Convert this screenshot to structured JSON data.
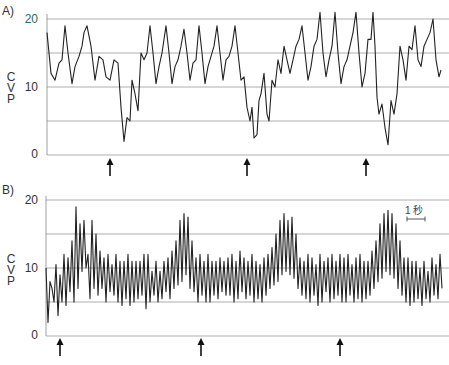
{
  "figure": {
    "panels": [
      {
        "label": "A)",
        "ylabel": [
          "C",
          "V",
          "P"
        ],
        "ticks": [
          "20",
          "10",
          "0"
        ],
        "tick_color_top": "#2a6b5a"
      },
      {
        "label": "B)",
        "ylabel": [
          "C",
          "V",
          "P"
        ],
        "ticks": [
          "20",
          "10",
          "0"
        ]
      }
    ],
    "scale_bar": {
      "label": "1 秒"
    }
  },
  "chart_data": [
    {
      "type": "line",
      "title": "A)",
      "ylabel": "CVP",
      "xlabel": "",
      "ylim": [
        0,
        20
      ],
      "yticks_labeled": [
        0,
        10,
        20
      ],
      "gridlines": [
        0,
        5,
        10,
        15,
        20
      ],
      "grid": true,
      "annotations": [
        {
          "type": "arrow",
          "x_px": 110,
          "description": "upward arrow marking event"
        },
        {
          "type": "arrow",
          "x_px": 247,
          "description": "upward arrow marking event"
        },
        {
          "type": "arrow",
          "x_px": 366,
          "description": "upward arrow marking event"
        }
      ],
      "x_px": [
        47,
        51,
        55,
        59,
        62,
        65,
        68,
        72,
        75,
        79,
        82,
        84,
        87,
        91,
        95,
        99,
        103,
        106,
        110,
        114,
        118,
        121,
        124,
        127,
        130,
        132,
        135,
        138,
        141,
        144,
        147,
        150,
        153,
        156,
        159,
        162,
        166,
        169,
        172,
        175,
        178,
        181,
        184,
        187,
        190,
        193,
        196,
        199,
        202,
        205,
        208,
        211,
        214,
        217,
        220,
        223,
        226,
        229,
        232,
        235,
        238,
        241,
        244,
        247,
        250,
        252,
        254,
        257,
        259,
        261,
        264,
        267,
        269,
        272,
        275,
        278,
        281,
        284,
        287,
        290,
        293,
        296,
        299,
        302,
        305,
        308,
        311,
        314,
        317,
        320,
        323,
        326,
        329,
        332,
        335,
        338,
        341,
        344,
        347,
        350,
        353,
        356,
        359,
        362,
        365,
        368,
        371,
        373,
        375,
        377,
        379,
        382,
        385,
        388,
        391,
        394,
        397,
        400,
        403,
        406,
        409,
        412,
        415,
        418,
        421,
        424,
        427,
        430,
        433,
        436,
        439,
        441
      ],
      "values": [
        18,
        12,
        11,
        13.5,
        14,
        19,
        15,
        10.5,
        13,
        14.5,
        16,
        18,
        19,
        16,
        11,
        14.5,
        14,
        11.5,
        11,
        14,
        13.5,
        7,
        2,
        5.5,
        5,
        11,
        9,
        6.5,
        15,
        14,
        15,
        19,
        15,
        10.5,
        13,
        15,
        19,
        15,
        10.5,
        13,
        14,
        16,
        18.5,
        15,
        11,
        13.5,
        14,
        19,
        15,
        10.5,
        13,
        14.5,
        16,
        19,
        15,
        11,
        14,
        14.5,
        16,
        19,
        15,
        11,
        11.5,
        7,
        5,
        7,
        2.5,
        3,
        8,
        9,
        12,
        6,
        5,
        11,
        10,
        14,
        12,
        16,
        14,
        12,
        14,
        16,
        17,
        19,
        15,
        11,
        13,
        16,
        17,
        21,
        15,
        11.5,
        14,
        16,
        21,
        15,
        10.5,
        13,
        14,
        16,
        18,
        21,
        15,
        10,
        12,
        17,
        17,
        21,
        16,
        8.5,
        6,
        7.5,
        4,
        1.5,
        8,
        6,
        9,
        16,
        14,
        11,
        16,
        15.5,
        19,
        14,
        13,
        16,
        17,
        18,
        20,
        14,
        11.5,
        12.5,
        16,
        17,
        17.5
      ]
    },
    {
      "type": "line",
      "title": "B)",
      "ylabel": "CVP",
      "xlabel": "",
      "ylim": [
        0,
        20
      ],
      "yticks_labeled": [
        0,
        10,
        20
      ],
      "gridlines": [
        0,
        5,
        10,
        15,
        20
      ],
      "grid": true,
      "annotations": [
        {
          "type": "arrow",
          "x_px": 60,
          "description": "upward arrow marking event"
        },
        {
          "type": "arrow",
          "x_px": 201,
          "description": "upward arrow marking event"
        },
        {
          "type": "arrow",
          "x_px": 340,
          "description": "upward arrow marking event"
        },
        {
          "type": "scale_bar",
          "label": "1 秒",
          "x_px": [
            407,
            425
          ]
        }
      ],
      "x_px": [
        46,
        48,
        50,
        52,
        54,
        56,
        58,
        60,
        62,
        64,
        66,
        68,
        70,
        72,
        74,
        76,
        78,
        80,
        82,
        84,
        86,
        88,
        90,
        92,
        94,
        96,
        98,
        100,
        102,
        104,
        106,
        108,
        110,
        112,
        114,
        116,
        118,
        120,
        122,
        124,
        126,
        128,
        130,
        132,
        134,
        136,
        138,
        140,
        142,
        144,
        146,
        148,
        150,
        152,
        154,
        156,
        158,
        160,
        162,
        164,
        166,
        168,
        170,
        172,
        174,
        176,
        178,
        180,
        182,
        184,
        186,
        188,
        190,
        192,
        194,
        196,
        198,
        200,
        202,
        204,
        206,
        208,
        210,
        212,
        214,
        216,
        218,
        220,
        222,
        224,
        226,
        228,
        230,
        232,
        234,
        236,
        238,
        240,
        242,
        244,
        246,
        248,
        250,
        252,
        254,
        256,
        258,
        260,
        262,
        264,
        266,
        268,
        270,
        272,
        274,
        276,
        278,
        280,
        282,
        284,
        286,
        288,
        290,
        292,
        294,
        296,
        298,
        300,
        302,
        304,
        306,
        308,
        310,
        312,
        314,
        316,
        318,
        320,
        322,
        324,
        326,
        328,
        330,
        332,
        334,
        336,
        338,
        340,
        342,
        344,
        346,
        348,
        350,
        352,
        354,
        356,
        358,
        360,
        362,
        364,
        366,
        368,
        370,
        372,
        374,
        376,
        378,
        380,
        382,
        384,
        386,
        388,
        390,
        392,
        394,
        396,
        398,
        400,
        402,
        404,
        406,
        408,
        410,
        412,
        414,
        416,
        418,
        420,
        422,
        424,
        426,
        428,
        430,
        432,
        434,
        436,
        438,
        440,
        442
      ],
      "values": [
        10,
        2,
        8,
        7,
        5,
        10.5,
        3,
        9,
        5,
        12,
        4.5,
        11.5,
        6.5,
        14,
        5,
        19,
        7,
        16.5,
        9.5,
        17,
        10,
        12,
        5.5,
        17,
        7,
        15,
        6,
        12.5,
        7,
        11.5,
        5,
        12,
        6.5,
        10.5,
        6,
        12,
        5,
        11,
        4.5,
        11,
        5.5,
        12,
        4.5,
        11,
        5,
        11,
        5.5,
        11,
        6,
        12,
        4,
        12,
        5,
        9.5,
        6,
        11,
        5,
        9.5,
        5.5,
        11,
        6.5,
        11.5,
        5.5,
        12.5,
        7,
        14,
        7.5,
        17,
        8,
        18,
        9,
        17.5,
        7,
        14,
        6.5,
        11.5,
        5,
        12,
        6,
        11,
        5,
        12,
        5,
        11,
        6,
        11,
        5.5,
        11.5,
        6.5,
        11,
        6,
        11.5,
        6,
        12,
        5,
        11,
        5.5,
        12.5,
        6.5,
        11.5,
        5.5,
        11,
        6,
        12,
        5,
        11,
        5.5,
        10.5,
        5,
        11.5,
        6,
        12,
        7,
        13,
        7.5,
        15,
        8,
        17,
        9,
        18,
        9.5,
        17,
        9,
        17.5,
        8.5,
        15,
        7,
        11.5,
        6,
        11,
        5.5,
        12,
        5,
        11.5,
        6,
        10.5,
        4.5,
        12,
        5,
        11,
        6.5,
        11.5,
        5,
        12,
        5.5,
        11,
        6,
        12,
        5,
        11.5,
        5,
        12,
        6,
        10.5,
        5,
        11.5,
        5.5,
        12,
        5,
        11,
        5.5,
        11,
        6,
        12.5,
        7,
        14,
        8,
        16.5,
        8.5,
        18,
        9.5,
        18.5,
        9,
        18,
        8.5,
        16.5,
        7,
        14,
        6,
        11.5,
        5,
        11.5,
        4.5,
        11,
        5,
        11,
        5.5,
        10,
        4.5,
        11,
        5.5,
        9.5,
        5,
        11.5,
        6,
        10.5,
        5.5,
        12,
        7,
        9.5,
        10
      ]
    }
  ]
}
